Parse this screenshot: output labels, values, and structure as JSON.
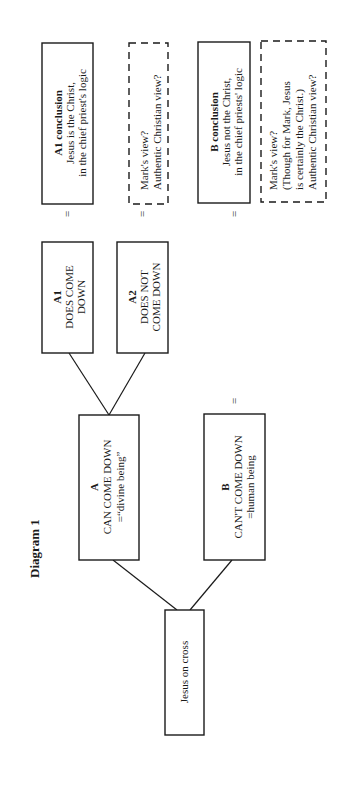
{
  "title": "Diagram 1",
  "nodes": {
    "root": {
      "lines": [
        "Jesus on cross"
      ]
    },
    "a": {
      "heading": "A",
      "lines": [
        "CAN COME DOWN",
        "=“divine being”"
      ]
    },
    "b": {
      "heading": "B",
      "lines": [
        "CAN'T COME DOWN",
        "=human being"
      ]
    },
    "a1": {
      "heading": "A1",
      "lines": [
        "DOES COME",
        "DOWN"
      ]
    },
    "a2": {
      "heading": "A2",
      "lines": [
        "DOES NOT",
        "COME DOWN"
      ]
    },
    "a1_conclusion": {
      "heading": "A1 conclusion",
      "lines": [
        "Jesus is the Christ,",
        "in the chief priest's logic"
      ]
    },
    "a2_view": {
      "lines": [
        "Mark's view?",
        "Authentic Christian view?"
      ]
    },
    "b_conclusion": {
      "heading": "B conclusion",
      "lines": [
        "Jesus not the Christ,",
        "in the chief priests' logic"
      ]
    },
    "b_view": {
      "lines": [
        "Mark's view?",
        "(Though for Mark, Jesus",
        "is certainly the Christ.)",
        "Authentic Christian view?"
      ]
    }
  },
  "equals_sign": "="
}
